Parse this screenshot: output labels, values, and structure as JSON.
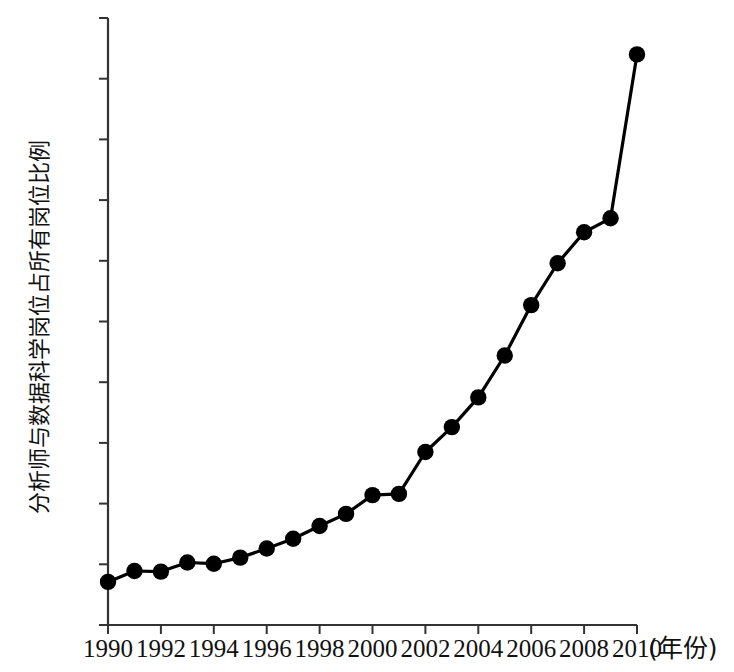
{
  "chart_data": {
    "type": "line",
    "title": "",
    "subtitle": "",
    "xlabel": "(年份)",
    "ylabel": "分析师与数据科学岗位占所有岗位比例",
    "x": [
      1990,
      1991,
      1992,
      1993,
      1994,
      1995,
      1996,
      1997,
      1998,
      1999,
      2000,
      2001,
      2002,
      2003,
      2004,
      2005,
      2006,
      2007,
      2008,
      2009,
      2010
    ],
    "values": [
      0.0071,
      0.0089,
      0.0088,
      0.0103,
      0.0101,
      0.0111,
      0.0126,
      0.0142,
      0.0163,
      0.0183,
      0.0214,
      0.0216,
      0.0285,
      0.0326,
      0.0375,
      0.0444,
      0.0527,
      0.0596,
      0.0647,
      0.067,
      0.094
    ],
    "series": [
      {
        "name": "分析师与数据科学岗位占所有岗位比例",
        "values": [
          0.0071,
          0.0089,
          0.0088,
          0.0103,
          0.0101,
          0.0111,
          0.0126,
          0.0142,
          0.0163,
          0.0183,
          0.0214,
          0.0216,
          0.0285,
          0.0326,
          0.0375,
          0.0444,
          0.0527,
          0.0596,
          0.0647,
          0.067,
          0.094
        ]
      }
    ],
    "xlim": [
      1990,
      2010
    ],
    "ylim": [
      0,
      0.1
    ],
    "ytick_labels": [
      "0",
      "0.01",
      "0.02",
      "0.03",
      "0.04",
      "0.05",
      "0.06",
      "0.07",
      "0.08",
      "0.09",
      "0.1"
    ],
    "ytick_values": [
      0,
      0.01,
      0.02,
      0.03,
      0.04,
      0.05,
      0.06,
      0.07,
      0.08,
      0.09,
      0.1
    ],
    "xtick_labels": [
      "1990",
      "1992",
      "1994",
      "1996",
      "1998",
      "2000",
      "2002",
      "2004",
      "2006",
      "2008",
      "2010"
    ],
    "xtick_values": [
      1990,
      1992,
      1994,
      1996,
      1998,
      2000,
      2002,
      2004,
      2006,
      2008,
      2010
    ],
    "grid": false,
    "legend": false,
    "legend_position": "none",
    "marker": "filled-circle",
    "line_color": "#000000",
    "marker_color": "#000000",
    "axis_color": "#333333",
    "background_color": "#ffffff"
  },
  "layout": {
    "plot_left": 108,
    "plot_right": 637,
    "plot_top": 18,
    "plot_bottom": 625,
    "tick_length": 9,
    "line_width": 3.2,
    "marker_radius": 8.2
  }
}
